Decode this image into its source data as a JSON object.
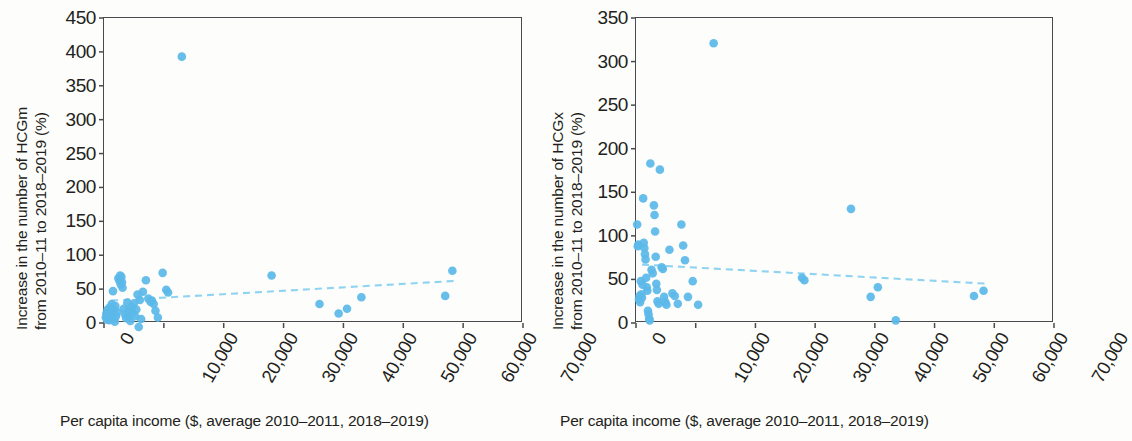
{
  "figure": {
    "background": "#fdfdfb",
    "marker_color": "#5bb8e8",
    "trend_color": "#8fd3f2",
    "axis_color": "#4a4a4f"
  },
  "panels": [
    {
      "id": "left",
      "y_title_line1": "Increase in the number of HCGm",
      "y_title_line2": "from 2010–11 to 2018–2019 (%)",
      "x_title": "Per capita income ($, average 2010–2011, 2018–2019)",
      "y_ticks": [
        "450",
        "400",
        "350",
        "300",
        "250",
        "200",
        "150",
        "100",
        "50",
        "0"
      ],
      "x_ticks": [
        "0",
        "10,000",
        "20,000",
        "30,000",
        "40,000",
        "50,000",
        "60,000",
        "70,000"
      ]
    },
    {
      "id": "right",
      "y_title_line1": "Increase in the number of HCGx",
      "y_title_line2": "from 2010–11 to 2018–2019 (%)",
      "x_title": "Per capita income ($, average 2010–2011, 2018–2019)",
      "y_ticks": [
        "350",
        "300",
        "250",
        "200",
        "150",
        "100",
        "50",
        "0"
      ],
      "x_ticks": [
        "0",
        "10,000",
        "20,000",
        "30,000",
        "40,000",
        "50,000",
        "60,000",
        "70,000"
      ]
    }
  ],
  "chart_data": [
    {
      "type": "scatter",
      "id": "hcgm",
      "title": "",
      "xlabel": "Per capita income ($, average 2010–2011, 2018–2019)",
      "ylabel": "Increase in the number of HCGm from 2010–11 to 2018–2019 (%)",
      "xlim": [
        0,
        70000
      ],
      "ylim": [
        0,
        450
      ],
      "xticks": [
        0,
        10000,
        20000,
        30000,
        40000,
        50000,
        60000,
        70000
      ],
      "yticks": [
        0,
        50,
        100,
        150,
        200,
        250,
        300,
        350,
        400,
        450
      ],
      "grid": false,
      "legend": null,
      "marker_color": "#5bb8e8",
      "points": [
        [
          300,
          8
        ],
        [
          400,
          14
        ],
        [
          500,
          5
        ],
        [
          600,
          20
        ],
        [
          700,
          11
        ],
        [
          800,
          17
        ],
        [
          900,
          4
        ],
        [
          1000,
          23
        ],
        [
          1100,
          9
        ],
        [
          1200,
          15
        ],
        [
          1300,
          28
        ],
        [
          1400,
          6
        ],
        [
          1500,
          47
        ],
        [
          1600,
          12
        ],
        [
          1700,
          19
        ],
        [
          1800,
          2
        ],
        [
          1900,
          25
        ],
        [
          2000,
          10
        ],
        [
          2200,
          16
        ],
        [
          2400,
          66
        ],
        [
          2600,
          62
        ],
        [
          2700,
          70
        ],
        [
          2800,
          57
        ],
        [
          2900,
          68
        ],
        [
          3000,
          60
        ],
        [
          3100,
          52
        ],
        [
          3300,
          21
        ],
        [
          3500,
          13
        ],
        [
          3700,
          7
        ],
        [
          3900,
          30
        ],
        [
          4000,
          9
        ],
        [
          4200,
          18
        ],
        [
          4400,
          3
        ],
        [
          4600,
          23
        ],
        [
          4800,
          15
        ],
        [
          5000,
          29
        ],
        [
          5200,
          10
        ],
        [
          5400,
          20
        ],
        [
          5600,
          42
        ],
        [
          5800,
          -6
        ],
        [
          6000,
          34
        ],
        [
          6200,
          6
        ],
        [
          6500,
          46
        ],
        [
          7000,
          63
        ],
        [
          7400,
          36
        ],
        [
          7800,
          31
        ],
        [
          8000,
          33
        ],
        [
          8300,
          28
        ],
        [
          8600,
          18
        ],
        [
          9000,
          8
        ],
        [
          9800,
          74
        ],
        [
          10400,
          49
        ],
        [
          10700,
          45
        ],
        [
          13000,
          393
        ],
        [
          28000,
          70
        ],
        [
          36000,
          28
        ],
        [
          39200,
          14
        ],
        [
          40600,
          21
        ],
        [
          43000,
          38
        ],
        [
          57000,
          40
        ],
        [
          58200,
          77
        ]
      ],
      "trendline": {
        "style": "dashed",
        "color": "#8fd3f2",
        "x_start": 1200,
        "y_start": 33,
        "x_end": 58500,
        "y_end": 62,
        "direction": "increasing"
      }
    },
    {
      "type": "scatter",
      "id": "hcgx",
      "title": "",
      "xlabel": "Per capita income ($, average 2010–2011, 2018–2019)",
      "ylabel": "Increase in the number of HCGx from 2010–11 to 2018–2019 (%)",
      "xlim": [
        0,
        70000
      ],
      "ylim": [
        0,
        350
      ],
      "xticks": [
        0,
        10000,
        20000,
        30000,
        40000,
        50000,
        60000,
        70000
      ],
      "yticks": [
        0,
        50,
        100,
        150,
        200,
        250,
        300,
        350
      ],
      "grid": false,
      "legend": null,
      "marker_color": "#5bb8e8",
      "points": [
        [
          200,
          113
        ],
        [
          300,
          88
        ],
        [
          400,
          90
        ],
        [
          500,
          27
        ],
        [
          600,
          31
        ],
        [
          700,
          24
        ],
        [
          800,
          48
        ],
        [
          900,
          33
        ],
        [
          1000,
          29
        ],
        [
          1100,
          44
        ],
        [
          1200,
          143
        ],
        [
          1300,
          92
        ],
        [
          1400,
          86
        ],
        [
          1500,
          79
        ],
        [
          1600,
          73
        ],
        [
          1700,
          52
        ],
        [
          1800,
          41
        ],
        [
          1900,
          37
        ],
        [
          2000,
          14
        ],
        [
          2100,
          10
        ],
        [
          2200,
          5
        ],
        [
          2300,
          3
        ],
        [
          2400,
          183
        ],
        [
          2600,
          61
        ],
        [
          2800,
          57
        ],
        [
          3000,
          135
        ],
        [
          3100,
          124
        ],
        [
          3200,
          105
        ],
        [
          3300,
          76
        ],
        [
          3400,
          45
        ],
        [
          3500,
          38
        ],
        [
          3600,
          25
        ],
        [
          3800,
          22
        ],
        [
          4000,
          176
        ],
        [
          4300,
          64
        ],
        [
          4500,
          62
        ],
        [
          4700,
          30
        ],
        [
          4900,
          24
        ],
        [
          5100,
          21
        ],
        [
          5600,
          84
        ],
        [
          6100,
          34
        ],
        [
          6500,
          31
        ],
        [
          7000,
          22
        ],
        [
          7600,
          113
        ],
        [
          7900,
          89
        ],
        [
          8200,
          72
        ],
        [
          8700,
          30
        ],
        [
          9500,
          48
        ],
        [
          10400,
          21
        ],
        [
          13000,
          321
        ],
        [
          27800,
          52
        ],
        [
          28200,
          49
        ],
        [
          36000,
          131
        ],
        [
          39300,
          30
        ],
        [
          40500,
          41
        ],
        [
          43500,
          3
        ],
        [
          56600,
          31
        ],
        [
          58200,
          37
        ]
      ],
      "trendline": {
        "style": "dashed",
        "color": "#8fd3f2",
        "x_start": 1000,
        "y_start": 67,
        "x_end": 59000,
        "y_end": 45,
        "direction": "decreasing"
      }
    }
  ]
}
